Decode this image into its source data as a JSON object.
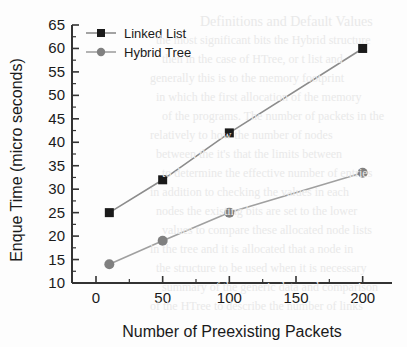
{
  "chart_data": {
    "type": "line",
    "title": "",
    "xlabel": "Number of Preexisting Packets",
    "ylabel": "Enque Time (micro seconds)",
    "x": [
      10,
      50,
      100,
      200
    ],
    "xlim": [
      -18,
      222
    ],
    "ylim": [
      10,
      65
    ],
    "xticks": [
      0,
      50,
      100,
      150,
      200
    ],
    "xticklabels": [
      "0",
      "50",
      "100",
      "150",
      "200"
    ],
    "yticks": [
      10,
      15,
      20,
      25,
      30,
      35,
      40,
      45,
      50,
      55,
      60,
      65
    ],
    "yticklabels": [
      "10",
      "15",
      "20",
      "25",
      "30",
      "35",
      "40",
      "45",
      "50",
      "55",
      "60",
      "65"
    ],
    "grid": false,
    "legend_position": "top-left",
    "series": [
      {
        "name": "Linked List",
        "marker": "square",
        "color": "#1a1a1a",
        "line_color": "#8c8c8c",
        "values": [
          25,
          32,
          42,
          60
        ]
      },
      {
        "name": "Hybrid Tree",
        "marker": "circle",
        "color": "#808080",
        "line_color": "#a0a0a0",
        "values": [
          14,
          19,
          25,
          33.5
        ]
      }
    ]
  },
  "axes": {
    "y_tick_labels": [
      "65",
      "60",
      "55",
      "50",
      "45",
      "40",
      "35",
      "30",
      "25",
      "20",
      "15",
      "10"
    ],
    "x_tick_labels": [
      "0",
      "50",
      "100",
      "150",
      "200"
    ],
    "x_axis_title": "Number of Preexisting Packets",
    "y_axis_title": "Enque Time (micro seconds)"
  },
  "legend": {
    "entries": [
      {
        "label": "Linked List"
      },
      {
        "label": "Hybrid Tree"
      }
    ]
  },
  "background_text": {
    "lines": [
      "Definitions and Default Values",
      "the most significant bits the Hybrid structure",
      "then in the case of HTree, or t list and",
      "generally this is to the memory footprint",
      "in which the first allocation of the memory",
      "of the programs. The number of packets in the",
      "relatively to how the number of   nodes",
      "between the it's that the limits between",
      "to determine the effective number of entries",
      "in addition to checking the values in each",
      "nodes the existing bits are set to the lower",
      "values to compare these allocated node lists",
      "in the tree and it is allocated that a node in",
      "the structure to be used when it is necessary",
      "summary of the generic data and comparison",
      "of the HTree to describe the number of links"
    ]
  }
}
